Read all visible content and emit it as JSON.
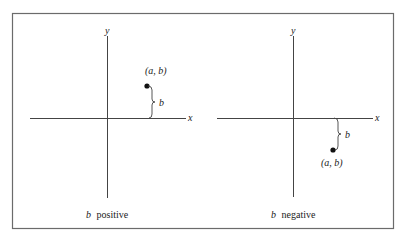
{
  "figure": {
    "colors": {
      "line": "#444444",
      "frame": "#6b6b6b",
      "point": "#111111",
      "text": "#222222",
      "background": "#ffffff"
    },
    "panels": [
      {
        "id": "left",
        "caption_var": "b",
        "caption_word": "positive",
        "x_axis_label": "x",
        "y_axis_label": "y",
        "point_label": "(a, b)",
        "distance_label": "b"
      },
      {
        "id": "right",
        "caption_var": "b",
        "caption_word": "negative",
        "x_axis_label": "x",
        "y_axis_label": "y",
        "point_label": "(a, b)",
        "distance_label": "b"
      }
    ]
  }
}
